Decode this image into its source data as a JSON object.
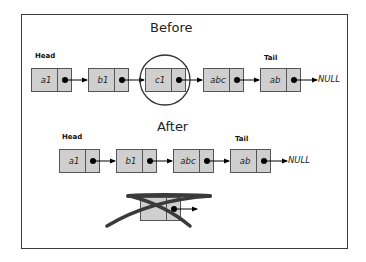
{
  "before": {
    "title": "Before",
    "head_label": "Head",
    "tail_label": "Tail",
    "nodes": [
      {
        "value": "a1"
      },
      {
        "value": "b1"
      },
      {
        "value": "c1",
        "highlighted": true
      },
      {
        "value": "abc"
      },
      {
        "value": "ab"
      }
    ],
    "terminator": "NULL"
  },
  "after": {
    "title": "After",
    "head_label": "Head",
    "tail_label": "Tail",
    "nodes": [
      {
        "value": "a1"
      },
      {
        "value": "b1"
      },
      {
        "value": "abc"
      },
      {
        "value": "ab"
      }
    ],
    "terminator": "NULL"
  },
  "deleted_node": {
    "value": "c1",
    "crossed_out": true
  },
  "colors": {
    "node_fill": "#cfcfcf",
    "border": "#555555",
    "frame": "#3a3a3a",
    "pointer": "#000000"
  }
}
